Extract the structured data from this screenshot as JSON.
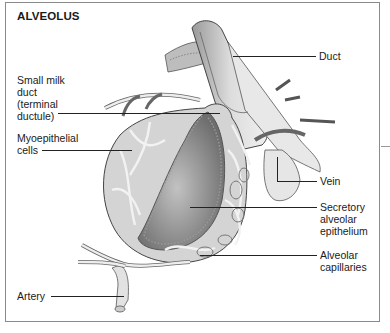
{
  "diagram": {
    "title": "ALVEOLUS",
    "labels": {
      "duct": "Duct",
      "small_milk_duct": "Small milk\nduct\n(terminal\nductule)",
      "myoepithelial": "Myoepithelial\ncells",
      "vein": "Vein",
      "secretory": "Secretory\nalveolar\nepithelium",
      "capillaries": "Alveolar\ncapillaries",
      "artery": "Artery"
    },
    "colors": {
      "frame": "#8a8a8a",
      "text": "#1a1a1a",
      "lumen": "#8c8c8c",
      "tissue": "#d4d4d4"
    }
  }
}
